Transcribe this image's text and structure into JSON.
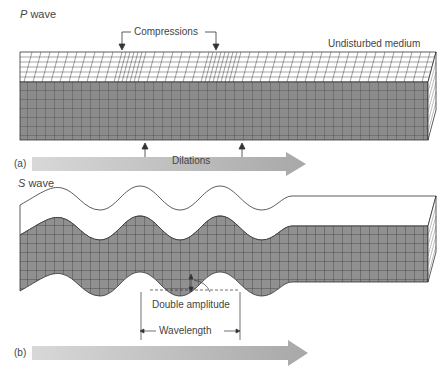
{
  "panel_a": {
    "title_italic": "P",
    "title_rest": " wave",
    "label": "(a)",
    "compressions": "Compressions",
    "dilations": "Dilations",
    "undisturbed": "Undisturbed medium"
  },
  "panel_b": {
    "title_italic": "S",
    "title_rest": " wave",
    "label": "(b)",
    "double_amplitude": "Double amplitude",
    "wavelength": "Wavelength"
  },
  "colors": {
    "block_face": "#8a8a8a",
    "grid_line": "#3a3a3a",
    "arrow_fill": "#b5b5b5",
    "text": "#444444"
  }
}
